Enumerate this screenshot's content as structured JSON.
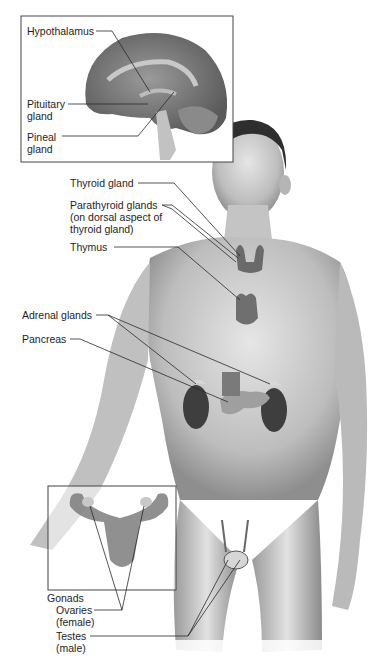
{
  "figure": {
    "background_color": "#ffffff",
    "skin_tone": "#c9c9c9",
    "line_color": "#333333"
  },
  "brain_inset": {
    "labels": {
      "hypothalamus": "Hypothalamus",
      "pituitary": "Pituitary\ngland",
      "pineal": "Pineal\ngland"
    }
  },
  "body_labels": {
    "thyroid": "Thyroid gland",
    "parathyroid": "Parathyroid glands\n(on dorsal aspect of\nthyroid gland)",
    "thymus": "Thymus",
    "adrenal": "Adrenal glands",
    "pancreas": "Pancreas"
  },
  "gonads_inset": {
    "labels": {
      "gonads": "Gonads",
      "ovaries": "Ovaries\n(female)",
      "testes": "Testes\n(male)"
    }
  }
}
